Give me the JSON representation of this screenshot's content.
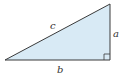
{
  "diagram": {
    "type": "right-triangle",
    "colors": {
      "fill": "#d8eaf5",
      "stroke": "#3a3a3a",
      "label": "#333333",
      "background": "#ffffff"
    },
    "vertices": {
      "bottom_left": [
        5,
        60
      ],
      "bottom_right": [
        110,
        60
      ],
      "top_right": [
        110,
        4
      ]
    },
    "right_angle_at": "bottom_right",
    "labels": {
      "hypotenuse": "c",
      "vertical_leg": "a",
      "horizontal_leg": "b"
    }
  }
}
